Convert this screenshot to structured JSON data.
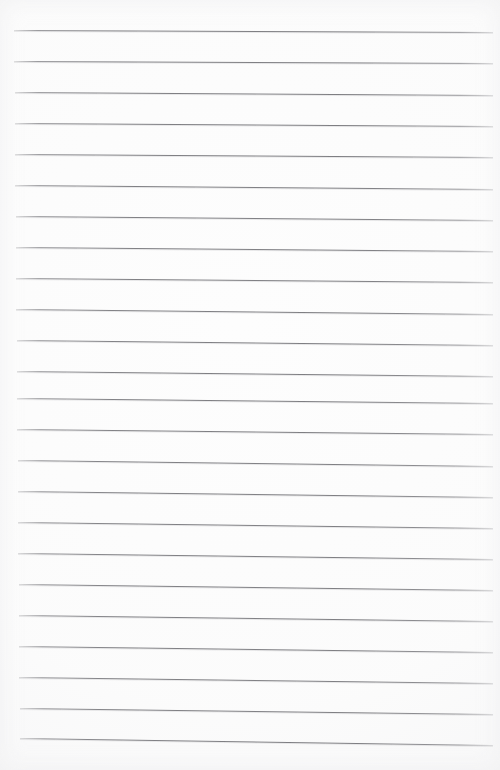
{
  "document": {
    "kind": "lined-paper",
    "title": "Blank ruled notebook page",
    "page_width": 500,
    "page_height": 770,
    "background_color": "#fdfdfd",
    "written_text": "",
    "has_margin_rule": false,
    "has_header": false,
    "has_page_number": false
  },
  "ruling": {
    "line_color": "#808084",
    "line_count": 24,
    "line_spacing": 31,
    "first_line_y": 30,
    "left_x": 14,
    "right_x": 493,
    "tilt_drop_px": 6,
    "lines": [
      {
        "index": 1,
        "y_left": 30,
        "y_right": 32
      },
      {
        "index": 2,
        "y_left": 61,
        "y_right": 63
      },
      {
        "index": 3,
        "y_left": 92,
        "y_right": 95
      },
      {
        "index": 4,
        "y_left": 123,
        "y_right": 126
      },
      {
        "index": 5,
        "y_left": 154,
        "y_right": 157
      },
      {
        "index": 6,
        "y_left": 185,
        "y_right": 189
      },
      {
        "index": 7,
        "y_left": 216,
        "y_right": 220
      },
      {
        "index": 8,
        "y_left": 247,
        "y_right": 251
      },
      {
        "index": 9,
        "y_left": 278,
        "y_right": 282
      },
      {
        "index": 10,
        "y_left": 309,
        "y_right": 314
      },
      {
        "index": 11,
        "y_left": 340,
        "y_right": 345
      },
      {
        "index": 12,
        "y_left": 371,
        "y_right": 376
      },
      {
        "index": 13,
        "y_left": 398,
        "y_right": 403
      },
      {
        "index": 14,
        "y_left": 429,
        "y_right": 434
      },
      {
        "index": 15,
        "y_left": 460,
        "y_right": 466
      },
      {
        "index": 16,
        "y_left": 491,
        "y_right": 497
      },
      {
        "index": 17,
        "y_left": 522,
        "y_right": 528
      },
      {
        "index": 18,
        "y_left": 553,
        "y_right": 559
      },
      {
        "index": 19,
        "y_left": 584,
        "y_right": 590
      },
      {
        "index": 20,
        "y_left": 615,
        "y_right": 621
      },
      {
        "index": 21,
        "y_left": 646,
        "y_right": 652
      },
      {
        "index": 22,
        "y_left": 677,
        "y_right": 683
      },
      {
        "index": 23,
        "y_left": 708,
        "y_right": 714
      },
      {
        "index": 24,
        "y_left": 738,
        "y_right": 745
      }
    ]
  }
}
